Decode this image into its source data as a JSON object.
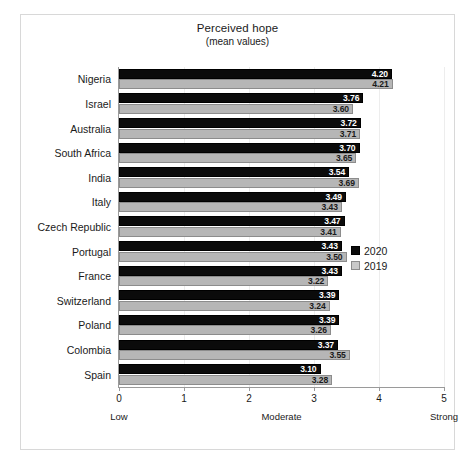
{
  "chart_data": {
    "type": "bar",
    "orientation": "horizontal",
    "title": "Perceived hope",
    "subtitle": "(mean values)",
    "xlabel": "",
    "ylabel": "",
    "xlim": [
      0,
      5
    ],
    "xticks": [
      0,
      1,
      2,
      3,
      4,
      5
    ],
    "xtick_labels": [
      "0",
      "1",
      "2",
      "3",
      "4",
      "5"
    ],
    "grid": true,
    "legend_position": "right",
    "anchor_labels": [
      {
        "text": "Low",
        "value": 0
      },
      {
        "text": "Moderate",
        "value": 2.5
      },
      {
        "text": "Strong",
        "value": 5
      }
    ],
    "categories": [
      "Nigeria",
      "Israel",
      "Australia",
      "South Africa",
      "India",
      "Italy",
      "Czech Republic",
      "Portugal",
      "France",
      "Switzerland",
      "Poland",
      "Colombia",
      "Spain"
    ],
    "series": [
      {
        "name": "2020",
        "color": "#0b0b0b",
        "values": [
          4.2,
          3.76,
          3.72,
          3.7,
          3.54,
          3.49,
          3.47,
          3.43,
          3.43,
          3.39,
          3.39,
          3.37,
          3.1
        ],
        "labels": [
          "4.20",
          "3.76",
          "3.72",
          "3.70",
          "3.54",
          "3.49",
          "3.47",
          "3.43",
          "3.43",
          "3.39",
          "3.39",
          "3.37",
          "3.10"
        ]
      },
      {
        "name": "2019",
        "color": "#b6b6b6",
        "values": [
          4.21,
          3.6,
          3.71,
          3.65,
          3.69,
          3.43,
          3.41,
          3.5,
          3.22,
          3.24,
          3.26,
          3.55,
          3.28
        ],
        "labels": [
          "4.21",
          "3.60",
          "3.71",
          "3.65",
          "3.69",
          "3.43",
          "3.41",
          "3.50",
          "3.22",
          "3.24",
          "3.26",
          "3.55",
          "3.28"
        ]
      }
    ]
  },
  "legend": {
    "items": [
      {
        "label": "2020"
      },
      {
        "label": "2019"
      }
    ]
  }
}
